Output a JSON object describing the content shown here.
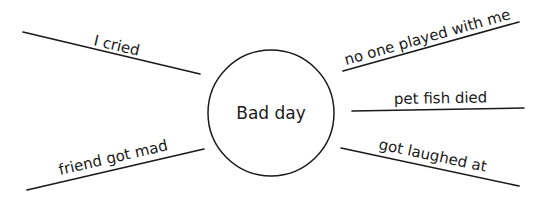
{
  "diagram": {
    "type": "spider-map",
    "center": {
      "label": "Bad day",
      "cx": 271,
      "cy": 113,
      "r": 63
    },
    "spokes": [
      {
        "id": "top-left",
        "label": "I cried",
        "line": {
          "x1": 23,
          "y1": 32,
          "x2": 200,
          "y2": 74
        },
        "text_x": 93,
        "text_y": 45,
        "angle": 13.4
      },
      {
        "id": "top-right",
        "label": "no one played with me",
        "line": {
          "x1": 343,
          "y1": 71,
          "x2": 519,
          "y2": 22
        },
        "text_x": 346,
        "text_y": 65,
        "angle": -15.6
      },
      {
        "id": "middle-right",
        "label": "pet fish died",
        "line": {
          "x1": 352,
          "y1": 111,
          "x2": 524,
          "y2": 108
        },
        "text_x": 394,
        "text_y": 104,
        "angle": -1.0
      },
      {
        "id": "bottom-right",
        "label": "got laughed at",
        "line": {
          "x1": 341,
          "y1": 148,
          "x2": 519,
          "y2": 186
        },
        "text_x": 378,
        "text_y": 149,
        "angle": 12.0
      },
      {
        "id": "bottom-left",
        "label": "friend got mad",
        "line": {
          "x1": 27,
          "y1": 190,
          "x2": 204,
          "y2": 149
        },
        "text_x": 60,
        "text_y": 175,
        "angle": -13.0
      }
    ],
    "colors": {
      "ink": "#1a1a1a",
      "background": "#ffffff"
    }
  }
}
